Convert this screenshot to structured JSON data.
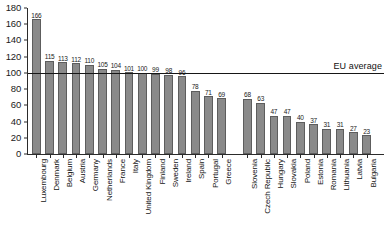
{
  "chart_data": {
    "type": "bar",
    "title": "",
    "subtitle": "",
    "xlabel": "",
    "ylabel": "",
    "ylim": [
      0,
      180
    ],
    "ytick_step": 20,
    "yticks": [
      0,
      20,
      40,
      60,
      80,
      100,
      120,
      140,
      160,
      180
    ],
    "grid": false,
    "legend": null,
    "categories": [
      "Luxembourg",
      "Denmark",
      "Belgium",
      "Austria",
      "Germany",
      "Netherlands",
      "France",
      "Italy",
      "United Kingdom",
      "Finland",
      "Sweden",
      "Ireland",
      "Spain",
      "Portugal",
      "Greece",
      "Slovenia",
      "Czech Republic",
      "Hungary",
      "Slovakia",
      "Poland",
      "Estonia",
      "Romania",
      "Lithuania",
      "Latvia",
      "Bulgaria"
    ],
    "values": [
      166,
      115,
      113,
      112,
      110,
      105,
      104,
      101,
      100,
      99,
      98,
      96,
      78,
      71,
      69,
      68,
      63,
      47,
      47,
      40,
      37,
      31,
      31,
      27,
      23
    ],
    "group_break_after_index": 14,
    "annotations": [
      {
        "name": "eu-average",
        "label": "EU average",
        "value": 100,
        "type": "horizontal-line"
      }
    ],
    "bar_color": "#8a8a8a",
    "bar_border_color": "#5d5d5d",
    "axis_color": "#2b2b2b",
    "annotation_color": "#161616"
  }
}
